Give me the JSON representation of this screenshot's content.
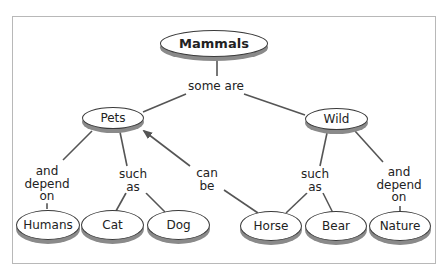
{
  "diagram": {
    "type": "concept-map",
    "colors": {
      "line": "#555555",
      "node_border": "#3a3a3a",
      "node_shadow": "#8a8a8a",
      "frame": "#b8b8b8"
    },
    "nodes": {
      "root": "Mammals",
      "pets": "Pets",
      "wild": "Wild",
      "humans": "Humans",
      "cat": "Cat",
      "dog": "Dog",
      "horse": "Horse",
      "bear": "Bear",
      "nature": "Nature"
    },
    "links": {
      "some_are": "some are",
      "pets_depend": [
        "and",
        "depend",
        "on"
      ],
      "pets_such_as": [
        "such",
        "as"
      ],
      "can_be": [
        "can",
        "be"
      ],
      "wild_such_as": [
        "such",
        "as"
      ],
      "wild_depend": [
        "and",
        "depend",
        "on"
      ]
    },
    "edges": [
      {
        "from": "Mammals",
        "to": "Pets",
        "label": "some are"
      },
      {
        "from": "Mammals",
        "to": "Wild",
        "label": "some are"
      },
      {
        "from": "Pets",
        "to": "Humans",
        "label": "and depend on"
      },
      {
        "from": "Pets",
        "to": "Cat",
        "label": "such as"
      },
      {
        "from": "Pets",
        "to": "Dog",
        "label": "such as"
      },
      {
        "from": "Horse",
        "to": "Pets",
        "label": "can be",
        "arrow": true
      },
      {
        "from": "Wild",
        "to": "Horse",
        "label": "such as"
      },
      {
        "from": "Wild",
        "to": "Bear",
        "label": "such as"
      },
      {
        "from": "Wild",
        "to": "Nature",
        "label": "and depend on"
      }
    ]
  }
}
